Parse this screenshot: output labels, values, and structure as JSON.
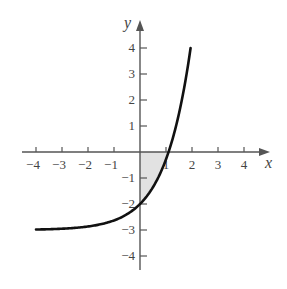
{
  "chart_data": {
    "type": "line",
    "title": "",
    "function": "y = e^x - 3",
    "xlabel": "x",
    "ylabel": "y",
    "xlim": [
      -4,
      4
    ],
    "ylim": [
      -4,
      4
    ],
    "x_ticks": [
      "-4",
      "-3",
      "-2",
      "-1",
      "1",
      "2",
      "3",
      "4"
    ],
    "y_ticks": [
      "4",
      "3",
      "2",
      "1",
      "-1",
      "-2",
      "-3",
      "-4"
    ],
    "x_tick_values": [
      -4,
      -3,
      -2,
      -1,
      1,
      2,
      3,
      4
    ],
    "y_tick_values": [
      4,
      3,
      2,
      1,
      -1,
      -2,
      -3,
      -4
    ],
    "series": [
      {
        "name": "curve",
        "x": [
          -4,
          -3,
          -2,
          -1,
          0,
          0.5,
          1,
          1.1,
          1.5,
          1.95
        ],
        "y": [
          -2.98,
          -2.95,
          -2.86,
          -2.63,
          -2,
          -1.35,
          -0.28,
          0,
          1.48,
          4
        ]
      }
    ],
    "shaded_region": {
      "description": "region between curve and x-axis for 0 <= x <= ln 3",
      "x_from": 0,
      "x_to": 1.1
    },
    "grid": false,
    "colors": {
      "curve": "#111111",
      "axes": "#555555",
      "shade": "#e2e2e2"
    }
  }
}
